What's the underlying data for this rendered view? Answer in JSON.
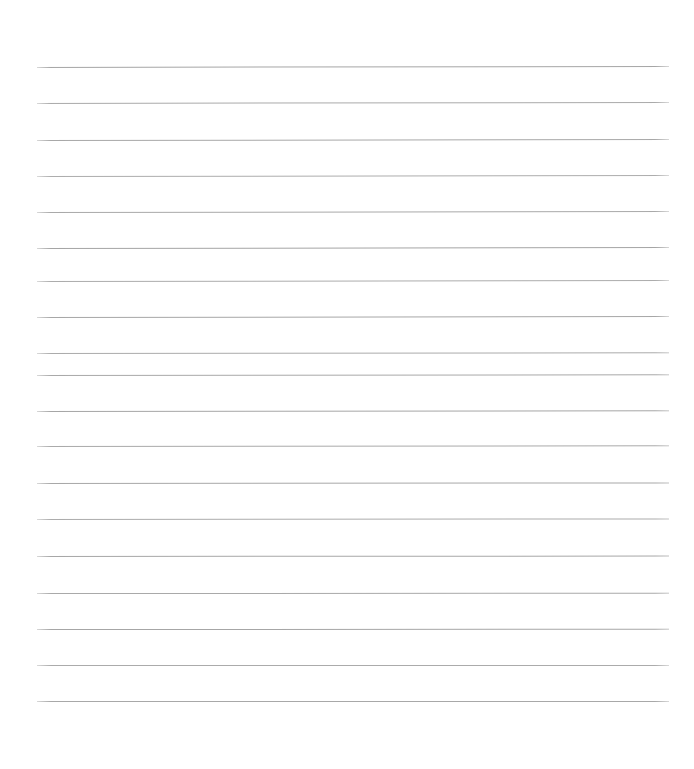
{
  "document": {
    "kind": "scanned-ruled-notepad-page",
    "title": "Ruled notepad page",
    "content_text": "",
    "handwriting_present": "no",
    "printed_text_present": "no"
  },
  "canvas": {
    "width": 694,
    "height": 769,
    "background_color": "#ffffff"
  },
  "ruling": {
    "line_count": 18,
    "line_color": "#a8a8a8",
    "line_thickness_px": 1,
    "line_spacing_px": 36.5,
    "first_line_y": 67,
    "last_line_y": 701,
    "left_margin_x": 37,
    "right_margin_x": 669,
    "line_length_px": 632,
    "scan_tilt_deg": -0.09,
    "top_blank_margin_px": 67,
    "bottom_blank_margin_px": 68
  },
  "lines": [
    {
      "index": 1,
      "y": 67,
      "tilt_deg": -0.1,
      "shade": "#a6a6a6"
    },
    {
      "index": 2,
      "y": 103,
      "tilt_deg": -0.1,
      "shade": "#aaaaaa"
    },
    {
      "index": 3,
      "y": 140,
      "tilt_deg": -0.09,
      "shade": "#a8a8a8"
    },
    {
      "index": 4,
      "y": 176,
      "tilt_deg": -0.09,
      "shade": "#adadad"
    },
    {
      "index": 5,
      "y": 212,
      "tilt_deg": -0.09,
      "shade": "#a9a9a9"
    },
    {
      "index": 6,
      "y": 248,
      "tilt_deg": -0.08,
      "shade": "#a5a5a5"
    },
    {
      "index": 7,
      "y": 281,
      "tilt_deg": -0.08,
      "shade": "#acacac"
    },
    {
      "index": 8,
      "y": 317,
      "tilt_deg": -0.08,
      "shade": "#a7a7a7"
    },
    {
      "index": 9,
      "y": 353,
      "tilt_deg": -0.07,
      "shade": "#ababab"
    },
    {
      "index": 10,
      "y": 375,
      "tilt_deg": -0.07,
      "shade": "#a9a9a9"
    },
    {
      "index": 11,
      "y": 411,
      "tilt_deg": -0.06,
      "shade": "#a6a6a6"
    },
    {
      "index": 12,
      "y": 446,
      "tilt_deg": -0.06,
      "shade": "#aaaaaa"
    },
    {
      "index": 13,
      "y": 483,
      "tilt_deg": -0.05,
      "shade": "#a8a8a8"
    },
    {
      "index": 14,
      "y": 519,
      "tilt_deg": -0.05,
      "shade": "#acacac"
    },
    {
      "index": 15,
      "y": 556,
      "tilt_deg": -0.04,
      "shade": "#a7a7a7"
    },
    {
      "index": 16,
      "y": 593,
      "tilt_deg": -0.03,
      "shade": "#a9a9a9"
    },
    {
      "index": 17,
      "y": 629,
      "tilt_deg": -0.02,
      "shade": "#a6a6a6"
    },
    {
      "index": 18,
      "y": 665,
      "tilt_deg": -0.01,
      "shade": "#ababab"
    },
    {
      "index": 19,
      "y": 701,
      "tilt_deg": 0.0,
      "shade": "#a8a8a8"
    }
  ]
}
